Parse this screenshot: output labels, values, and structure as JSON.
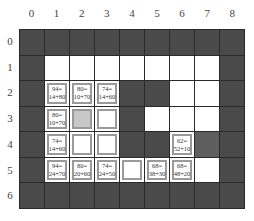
{
  "columns": [
    "0",
    "1",
    "2",
    "3",
    "4",
    "5",
    "6",
    "7",
    "8"
  ],
  "rows": [
    "0",
    "1",
    "2",
    "3",
    "4",
    "5",
    "6"
  ],
  "legend_types": {
    "wall": "obstacle (dark)",
    "open": "free (white)",
    "mid": "medium gray",
    "open_node": "open-list node (white box)",
    "closed_node": "closed/current node (gray box)"
  },
  "cells": [
    [
      "wall",
      "wall",
      "wall",
      "wall",
      "wall",
      "wall",
      "wall",
      "wall",
      "wall"
    ],
    [
      "wall",
      "open",
      "open",
      "open",
      "open",
      "open",
      "open",
      "open",
      "wall"
    ],
    [
      "wall",
      {
        "f": "94=",
        "gh": "14+80"
      },
      {
        "f": "80=",
        "gh": "10+70"
      },
      {
        "f": "74=",
        "gh": "14+60"
      },
      "wall",
      "wall",
      "open",
      "open",
      "wall"
    ],
    [
      "wall",
      {
        "f": "80=",
        "gh": "10+70"
      },
      "closed_node",
      "open_node",
      "wall",
      "open",
      "open",
      "open",
      "wall"
    ],
    [
      "wall",
      {
        "f": "74=",
        "gh": "14+60"
      },
      "open_node",
      "open_node",
      "wall",
      "wall",
      {
        "f": "62=",
        "gh": "52+10"
      },
      "mid",
      "wall"
    ],
    [
      "wall",
      {
        "f": "94=",
        "gh": "24+70"
      },
      {
        "f": "80=",
        "gh": "20+60"
      },
      {
        "f": "74=",
        "gh": "24+50"
      },
      "open_node",
      {
        "f": "68=",
        "gh": "38+30"
      },
      {
        "f": "68=",
        "gh": "48+20"
      },
      "open",
      "wall"
    ],
    [
      "wall",
      "wall",
      "wall",
      "wall",
      "wall",
      "wall",
      "wall",
      "wall",
      "wall"
    ]
  ]
}
